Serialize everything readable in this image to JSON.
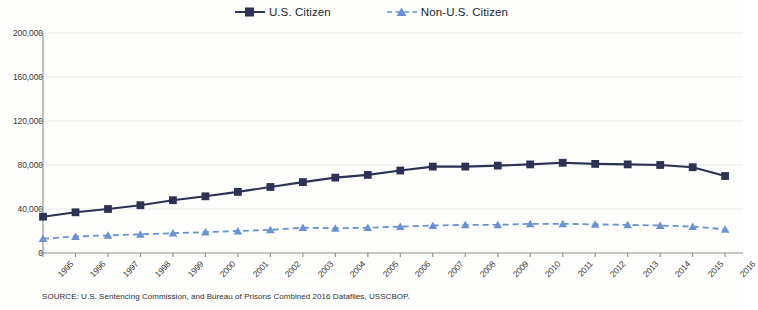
{
  "legend": {
    "entries": [
      {
        "label": "U.S. Citizen",
        "color": "#2d3254",
        "marker": "square-marker-icon",
        "dash": "solid"
      },
      {
        "label": "Non-U.S. Citizen",
        "color": "#6b92d0",
        "marker": "triangle-marker-icon",
        "dash": "dashed"
      }
    ]
  },
  "source_note": "SOURCE:  U.S. Sentencing Commission, and Bureau of Prisons Combined 2016 Datafiles, USSCBOP.",
  "chart_data": {
    "type": "line",
    "title": "",
    "subtitle": "",
    "xlabel": "",
    "ylabel": "",
    "grid": true,
    "legend_position": "top-center",
    "xlim": [
      1995,
      2016
    ],
    "ylim": [
      0,
      200000
    ],
    "ytick_labels": [
      "0",
      "40,000",
      "80,000",
      "120,000",
      "160,000",
      "200,000"
    ],
    "ytick_values": [
      0,
      40000,
      80000,
      120000,
      160000,
      200000
    ],
    "categories": [
      "1995",
      "1996",
      "1997",
      "1998",
      "1999",
      "2000",
      "2001",
      "2002",
      "2003",
      "2004",
      "2005",
      "2006",
      "2007",
      "2008",
      "2009",
      "2010",
      "2011",
      "2012",
      "2013",
      "2014",
      "2015",
      "2016"
    ],
    "series": [
      {
        "name": "U.S. Citizen",
        "color": "#2d3254",
        "dash": "solid",
        "marker": "square",
        "values": [
          33000,
          37000,
          40000,
          43500,
          48000,
          51500,
          55500,
          60000,
          64500,
          68500,
          71000,
          75000,
          78500,
          78500,
          79500,
          80500,
          82000,
          81000,
          80500,
          80000,
          78000,
          70000
        ]
      },
      {
        "name": "Non-U.S. Citizen",
        "color": "#6b92d0",
        "dash": "dashed",
        "marker": "triangle",
        "values": [
          13000,
          15000,
          16000,
          17000,
          18000,
          19000,
          20000,
          21000,
          23000,
          22500,
          23000,
          24000,
          25000,
          25500,
          25500,
          26500,
          26500,
          26000,
          25500,
          25000,
          24000,
          21500
        ]
      }
    ]
  }
}
